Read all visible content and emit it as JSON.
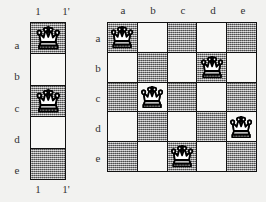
{
  "figure": {
    "piece_icon": "queen-crown-icon",
    "colors": {
      "background": "#f2f2f0",
      "light_square": "#f8f8f6",
      "dark_square": "#909090",
      "border": "#111111",
      "label_text": "#333333"
    }
  },
  "left_board": {
    "name": "single-file-board",
    "files": [
      "1"
    ],
    "ranks": [
      "a",
      "b",
      "c",
      "d",
      "e"
    ],
    "top_labels": [
      "1",
      "1'"
    ],
    "bottom_labels": [
      "1",
      "1'"
    ],
    "columns": 1,
    "rows": 5,
    "squares": [
      {
        "rank": "a",
        "file": "1",
        "shade": "dark",
        "piece": "queen"
      },
      {
        "rank": "b",
        "file": "1",
        "shade": "light",
        "piece": ""
      },
      {
        "rank": "c",
        "file": "1",
        "shade": "dark",
        "piece": "queen"
      },
      {
        "rank": "d",
        "file": "1",
        "shade": "light",
        "piece": ""
      },
      {
        "rank": "e",
        "file": "1",
        "shade": "dark",
        "piece": ""
      }
    ],
    "queen_count": 2,
    "queen_positions": [
      "1a",
      "1c"
    ]
  },
  "right_board": {
    "name": "five-by-five-board",
    "files": [
      "a",
      "b",
      "c",
      "d",
      "e"
    ],
    "ranks": [
      "a",
      "b",
      "c",
      "d",
      "e"
    ],
    "columns": 5,
    "rows": 5,
    "squares": [
      {
        "rank": "a",
        "file": "a",
        "shade": "dark",
        "piece": "queen"
      },
      {
        "rank": "a",
        "file": "b",
        "shade": "light",
        "piece": ""
      },
      {
        "rank": "a",
        "file": "c",
        "shade": "dark",
        "piece": ""
      },
      {
        "rank": "a",
        "file": "d",
        "shade": "light",
        "piece": ""
      },
      {
        "rank": "a",
        "file": "e",
        "shade": "dark",
        "piece": ""
      },
      {
        "rank": "b",
        "file": "a",
        "shade": "light",
        "piece": ""
      },
      {
        "rank": "b",
        "file": "b",
        "shade": "dark",
        "piece": ""
      },
      {
        "rank": "b",
        "file": "c",
        "shade": "light",
        "piece": ""
      },
      {
        "rank": "b",
        "file": "d",
        "shade": "dark",
        "piece": "queen"
      },
      {
        "rank": "b",
        "file": "e",
        "shade": "light",
        "piece": ""
      },
      {
        "rank": "c",
        "file": "a",
        "shade": "dark",
        "piece": ""
      },
      {
        "rank": "c",
        "file": "b",
        "shade": "light",
        "piece": "queen"
      },
      {
        "rank": "c",
        "file": "c",
        "shade": "dark",
        "piece": ""
      },
      {
        "rank": "c",
        "file": "d",
        "shade": "light",
        "piece": ""
      },
      {
        "rank": "c",
        "file": "e",
        "shade": "dark",
        "piece": ""
      },
      {
        "rank": "d",
        "file": "a",
        "shade": "light",
        "piece": ""
      },
      {
        "rank": "d",
        "file": "b",
        "shade": "dark",
        "piece": ""
      },
      {
        "rank": "d",
        "file": "c",
        "shade": "light",
        "piece": ""
      },
      {
        "rank": "d",
        "file": "d",
        "shade": "dark",
        "piece": ""
      },
      {
        "rank": "d",
        "file": "e",
        "shade": "light",
        "piece": "queen"
      },
      {
        "rank": "e",
        "file": "a",
        "shade": "dark",
        "piece": ""
      },
      {
        "rank": "e",
        "file": "b",
        "shade": "light",
        "piece": ""
      },
      {
        "rank": "e",
        "file": "c",
        "shade": "dark",
        "piece": "queen"
      },
      {
        "rank": "e",
        "file": "d",
        "shade": "light",
        "piece": ""
      },
      {
        "rank": "e",
        "file": "e",
        "shade": "dark",
        "piece": ""
      }
    ],
    "queen_count": 5,
    "queen_positions": [
      "aa",
      "db",
      "bc",
      "ed",
      "ce"
    ]
  }
}
